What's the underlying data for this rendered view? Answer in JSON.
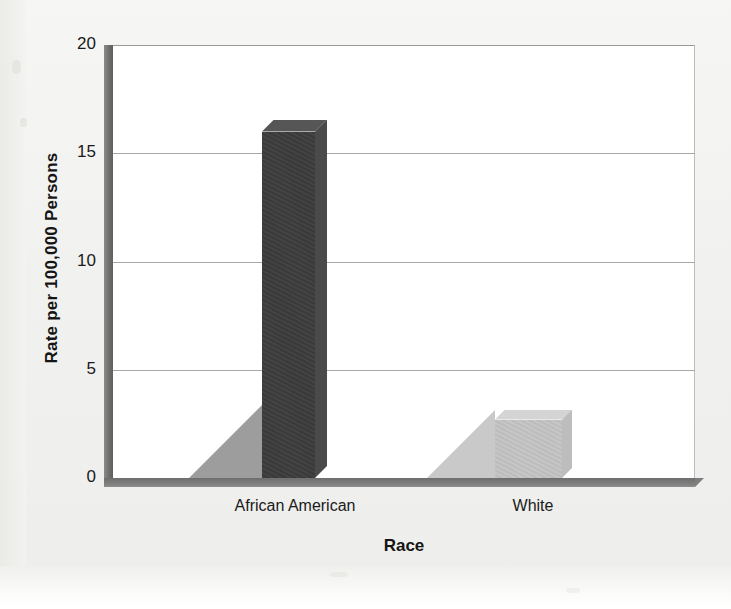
{
  "chart_data": {
    "type": "bar",
    "title": "",
    "subtitle": "",
    "xlabel": "Race",
    "ylabel": "Rate per 100,000 Persons",
    "categories": [
      "African American",
      "White"
    ],
    "values": [
      16.0,
      2.7
    ],
    "series": [
      {
        "name": "Rate per 100,000 Persons",
        "values": [
          16.0,
          2.7
        ],
        "colors": [
          "#3c3c3c",
          "#c3c3c3"
        ]
      }
    ],
    "ylim": [
      0,
      20
    ],
    "yticks": [
      0,
      5,
      10,
      15,
      20
    ],
    "ytick_labels": [
      "0",
      "5",
      "10",
      "15",
      "20"
    ],
    "xtick_labels": [
      "African American",
      "White"
    ],
    "grid": true,
    "grid_axis": "y",
    "legend": false,
    "legend_position": "none",
    "style": "3d-column",
    "annotations": []
  },
  "axes": {
    "y_title": "Rate per 100,000 Persons",
    "x_title": "Race",
    "y_ticks": [
      {
        "label": "20",
        "value": 20
      },
      {
        "label": "15",
        "value": 15
      },
      {
        "label": "10",
        "value": 10
      },
      {
        "label": "5",
        "value": 5
      },
      {
        "label": "0",
        "value": 0
      }
    ],
    "x_ticks": [
      {
        "label": "African American"
      },
      {
        "label": "White"
      }
    ]
  },
  "bars": [
    {
      "category": "African American",
      "value": 16.0,
      "color": "#3c3c3c"
    },
    {
      "category": "White",
      "value": 2.7,
      "color": "#c3c3c3"
    }
  ],
  "colors": {
    "bar_african_american": "#3c3c3c",
    "bar_white": "#c3c3c3",
    "gridline": "#a8a8a8",
    "axis_wall": "#6f6f6f",
    "plot_background": "#ffffff",
    "page_background": "#f1f1ef",
    "text": "#151515"
  }
}
